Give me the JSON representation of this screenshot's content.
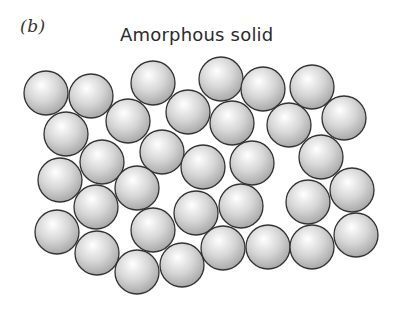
{
  "figure": {
    "panel_label": "(b)",
    "title": "Amorphous solid"
  },
  "style": {
    "sphere_fill_highlight": "#ffffff",
    "sphere_fill_mid": "#d6d6d6",
    "sphere_fill_edge": "#a8a8a8",
    "sphere_stroke": "#333333",
    "sphere_radius": 22
  },
  "spheres": [
    {
      "cx": 46,
      "cy": 93
    },
    {
      "cx": 91,
      "cy": 96
    },
    {
      "cx": 153,
      "cy": 83
    },
    {
      "cx": 221,
      "cy": 79
    },
    {
      "cx": 263,
      "cy": 89
    },
    {
      "cx": 312,
      "cy": 87
    },
    {
      "cx": 344,
      "cy": 118
    },
    {
      "cx": 289,
      "cy": 125
    },
    {
      "cx": 232,
      "cy": 123
    },
    {
      "cx": 188,
      "cy": 112
    },
    {
      "cx": 128,
      "cy": 121
    },
    {
      "cx": 66,
      "cy": 134
    },
    {
      "cx": 102,
      "cy": 162
    },
    {
      "cx": 162,
      "cy": 152
    },
    {
      "cx": 203,
      "cy": 167
    },
    {
      "cx": 252,
      "cy": 163
    },
    {
      "cx": 321,
      "cy": 157
    },
    {
      "cx": 60,
      "cy": 180
    },
    {
      "cx": 137,
      "cy": 188
    },
    {
      "cx": 96,
      "cy": 207
    },
    {
      "cx": 196,
      "cy": 213
    },
    {
      "cx": 241,
      "cy": 206
    },
    {
      "cx": 308,
      "cy": 202
    },
    {
      "cx": 352,
      "cy": 190
    },
    {
      "cx": 57,
      "cy": 232
    },
    {
      "cx": 153,
      "cy": 230
    },
    {
      "cx": 97,
      "cy": 253
    },
    {
      "cx": 137,
      "cy": 272
    },
    {
      "cx": 182,
      "cy": 265
    },
    {
      "cx": 223,
      "cy": 248
    },
    {
      "cx": 268,
      "cy": 247
    },
    {
      "cx": 312,
      "cy": 247
    },
    {
      "cx": 356,
      "cy": 235
    }
  ]
}
